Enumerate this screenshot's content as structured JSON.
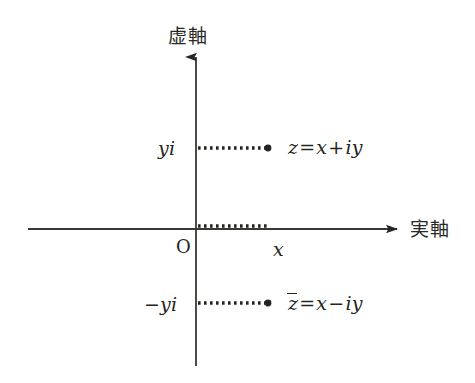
{
  "figure": {
    "type": "complex-plane-diagram",
    "background_color": "#ffffff",
    "ink_color": "#262420",
    "width": 475,
    "height": 383
  },
  "axes": {
    "imaginary": {
      "label": "虚軸",
      "label_x": 168,
      "label_y": 27,
      "orientation": "vertical",
      "arrow": "up",
      "x": 196,
      "top_y": 55,
      "bottom_y": 366
    },
    "real": {
      "label": "実軸",
      "label_x": 410,
      "label_y": 220,
      "orientation": "horizontal",
      "arrow": "right",
      "y": 229,
      "left_x": 28,
      "right_x": 399
    },
    "origin_label": "O",
    "origin_label_x": 176,
    "origin_label_y": 238
  },
  "points": [
    {
      "name": "z",
      "label": "z = x + iy",
      "label_parts": {
        "lhs": "z",
        "eq": "=",
        "re": "x",
        "sign": "+",
        "im": "iy"
      },
      "dot_x": 268,
      "dot_y": 148,
      "label_x": 288,
      "label_y": 138,
      "axis_tick_label": "yi",
      "axis_tick_label_x": 158,
      "axis_tick_label_y": 139,
      "overbar": false
    },
    {
      "name": "z-conjugate",
      "label": "z̄ = x − iy",
      "label_parts": {
        "lhs": "z",
        "eq": "=",
        "re": "x",
        "sign": "−",
        "im": "iy"
      },
      "dot_x": 268,
      "dot_y": 303,
      "label_x": 288,
      "label_y": 294,
      "axis_tick_label": "−yi",
      "axis_tick_label_x": 144,
      "axis_tick_label_y": 295,
      "overbar": true
    }
  ],
  "real_projection": {
    "label": "x",
    "label_x": 273,
    "label_y": 240,
    "dotted_from_x": 196,
    "dotted_to_x": 270,
    "dotted_y": 226
  },
  "dotted_guides": [
    {
      "name": "guide-to-z",
      "x1": 197,
      "y1": 148,
      "x2": 266,
      "y2": 148
    },
    {
      "name": "guide-to-z-conjugate",
      "x1": 197,
      "y1": 303,
      "x2": 266,
      "y2": 303
    },
    {
      "name": "guide-real-projection",
      "x1": 197,
      "y1": 226,
      "x2": 269,
      "y2": 226
    }
  ]
}
